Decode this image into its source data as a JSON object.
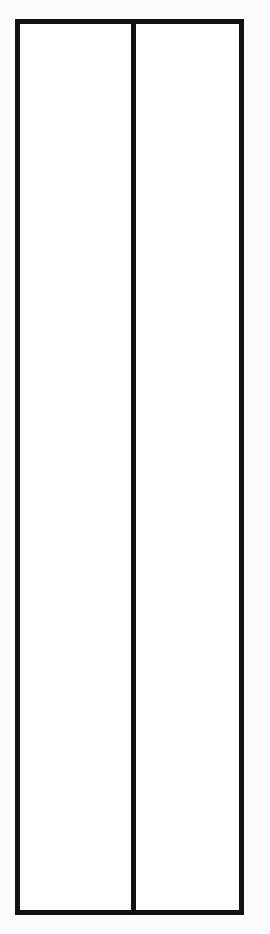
{
  "diagram": {
    "stroke_color": "#111111",
    "background_color": "#fbfbfb",
    "fill_color": "#ffffff",
    "outer_rect": {
      "x": 17.5,
      "y": 21.5,
      "width": 224,
      "height": 891
    },
    "divider": {
      "x1": 133.5,
      "y1": 21.5,
      "x2": 133.5,
      "y2": 912.5
    },
    "columns": [
      {
        "label": ""
      },
      {
        "label": ""
      }
    ]
  }
}
